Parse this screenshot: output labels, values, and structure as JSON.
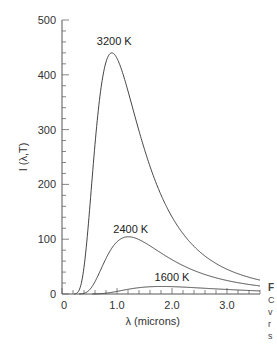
{
  "chart_data": {
    "type": "line",
    "title": "",
    "xlabel": "λ (microns)",
    "ylabel": "I (λ,T)",
    "xlim": [
      0,
      3.6
    ],
    "ylim": [
      0,
      500
    ],
    "x_ticks": [
      {
        "value": 0,
        "label": "0"
      },
      {
        "value": 1.0,
        "label": "1.0"
      },
      {
        "value": 2.0,
        "label": "2.0"
      },
      {
        "value": 3.0,
        "label": "3.0"
      }
    ],
    "x_minor_step": 0.2,
    "y_ticks": [
      {
        "value": 0,
        "label": "0"
      },
      {
        "value": 100,
        "label": "100"
      },
      {
        "value": 200,
        "label": "200"
      },
      {
        "value": 300,
        "label": "300"
      },
      {
        "value": 400,
        "label": "400"
      },
      {
        "value": 500,
        "label": "500"
      }
    ],
    "y_minor_step": 20,
    "grid": false,
    "legend": "inline labels",
    "series": [
      {
        "name": "3200 K",
        "temperature": 3200,
        "peak_x": 0.91,
        "peak_y": 440,
        "x": [
          0.25,
          0.4,
          0.6,
          0.8,
          0.91,
          1.0,
          1.2,
          1.5,
          2.0,
          2.5,
          3.0,
          3.5
        ],
        "y": [
          1,
          52,
          243,
          408,
          440,
          435,
          374,
          253,
          124,
          66,
          38,
          24
        ]
      },
      {
        "name": "2400 K",
        "temperature": 2400,
        "peak_x": 1.21,
        "peak_y": 101,
        "x": [
          0.4,
          0.6,
          0.8,
          1.0,
          1.21,
          1.5,
          2.0,
          2.5,
          3.0,
          3.5
        ],
        "y": [
          1,
          15,
          54,
          90,
          101,
          90,
          62,
          40,
          27,
          19
        ]
      },
      {
        "name": "1600 K",
        "temperature": 1600,
        "peak_x": 1.81,
        "peak_y": 13,
        "x": [
          0.6,
          0.8,
          1.0,
          1.5,
          1.81,
          2.0,
          2.5,
          3.0,
          3.5
        ],
        "y": [
          0.3,
          1.8,
          5,
          12,
          13,
          13,
          11,
          9,
          7
        ]
      }
    ],
    "label_positions": [
      {
        "series": "3200 K",
        "x": 0.95,
        "y": 455
      },
      {
        "series": "2400 K",
        "x": 1.25,
        "y": 112
      },
      {
        "series": "1600 K",
        "x": 2.0,
        "y": 24
      }
    ]
  },
  "side_text": {
    "heading_fragment": "F",
    "lines": [
      "C",
      "v",
      "r",
      "s"
    ]
  }
}
